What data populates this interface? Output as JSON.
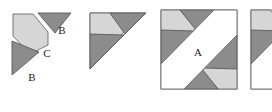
{
  "diagram": {
    "colors": {
      "light_gray": "#d6d6d6",
      "dark_gray": "#8c8c8c",
      "mid_gray": "#a8a8a8",
      "outline": "#4a4a4a",
      "white": "#ffffff",
      "label_color": "#1a1a1a",
      "background": "#ffffff"
    },
    "figures": [
      {
        "id": "exploded",
        "name": "exploded-pieces",
        "labels": [
          {
            "text": "B",
            "x": 62,
            "y": 34
          },
          {
            "text": "C",
            "x": 47,
            "y": 56
          },
          {
            "text": "B",
            "x": 32,
            "y": 80
          }
        ]
      },
      {
        "id": "assembled",
        "name": "assembled-triangle",
        "labels": []
      },
      {
        "id": "square",
        "name": "square-with-band",
        "labels": [
          {
            "text": "A",
            "x": 41,
            "y": 55
          }
        ]
      },
      {
        "id": "partial",
        "name": "partial-clipped-figure",
        "labels": []
      }
    ]
  }
}
